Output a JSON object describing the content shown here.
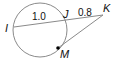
{
  "diagram": {
    "type": "circle-secant-tangent",
    "points": {
      "I": {
        "label": "I"
      },
      "J": {
        "label": "J"
      },
      "K": {
        "label": "K"
      },
      "M": {
        "label": "M"
      }
    },
    "segments": {
      "IJ": {
        "label": "1.0"
      },
      "JK": {
        "label": "0.8"
      }
    },
    "colors": {
      "circle": "#8a8a8a",
      "lines": "#8a8a8a",
      "text": "#111111",
      "point": "#000000"
    }
  }
}
